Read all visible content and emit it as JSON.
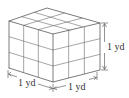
{
  "figure": {
    "grid_divisions": 3,
    "line_color": "#5a5a5a",
    "background": "#ffffff"
  },
  "labels": {
    "height": "1 yd",
    "width_left": "1 yd",
    "width_right": "1 yd"
  }
}
